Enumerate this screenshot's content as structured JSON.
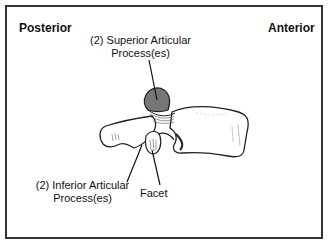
{
  "diagram": {
    "orientation": {
      "left_label": "Posterior",
      "right_label": "Anterior"
    },
    "labels": {
      "superior": {
        "line1": "(2) Superior Articular",
        "line2": "Process(es)"
      },
      "inferior": {
        "line1": "(2) Inferior Articular",
        "line2": "Process(es)"
      },
      "facet": "Facet"
    },
    "colors": {
      "border": "#333333",
      "text": "#111111",
      "superior_process_fill": "#777777",
      "bone_fill": "#ffffff",
      "outline": "#222222"
    }
  }
}
